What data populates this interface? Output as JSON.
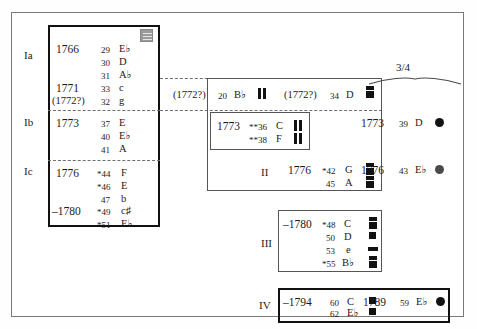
{
  "figure": {
    "time_signature_label": "3/4",
    "groups": {
      "Ia": "Ia",
      "Ib": "Ib",
      "Ic": "Ic",
      "II": "II",
      "III": "III",
      "IV": "IV"
    }
  },
  "column_left": {
    "sections": [
      {
        "group": "Ia",
        "entries": [
          {
            "year": "1766",
            "num": "29",
            "key": "E♭"
          },
          {
            "year": "",
            "num": "30",
            "key": "D"
          },
          {
            "year": "",
            "num": "31",
            "key": "A♭"
          },
          {
            "year": "1771",
            "num": "33",
            "key": "c"
          },
          {
            "year": "(1772?)",
            "num": "32",
            "key": "g"
          }
        ]
      },
      {
        "group": "Ib",
        "entries": [
          {
            "year": "1773",
            "num": "37",
            "key": "E"
          },
          {
            "year": "",
            "num": "40",
            "key": "E♭"
          },
          {
            "year": "",
            "num": "41",
            "key": "A"
          }
        ]
      },
      {
        "group": "Ic",
        "entries": [
          {
            "year": "1776",
            "num": "*44",
            "key": "F"
          },
          {
            "year": "",
            "num": "*46",
            "key": "E"
          },
          {
            "year": "",
            "num": "47",
            "key": "b"
          },
          {
            "year": "–1780",
            "num": "*49",
            "key": "c♯"
          },
          {
            "year": "",
            "num": "*51",
            "key": "E♭"
          }
        ]
      }
    ]
  },
  "column_middle": {
    "top_row": [
      {
        "year": "(1772?)",
        "num": "20",
        "key": "B♭",
        "marker": "bar-pair"
      },
      {
        "year": "(1772?)",
        "num": "34",
        "key": "D",
        "marker": "stacked-square"
      }
    ],
    "box_1773": {
      "entries": [
        {
          "year": "1773",
          "num": "**36",
          "key": "C",
          "marker": "bar-pair"
        },
        {
          "year": "",
          "num": "**38",
          "key": "F",
          "marker": "bar-pair"
        }
      ]
    },
    "section_II": {
      "group": "II",
      "entries": [
        {
          "year": "1776",
          "num": "*42",
          "key": "G",
          "marker": "stacked-square"
        },
        {
          "year": "",
          "num": "45",
          "key": "A",
          "marker": "stacked-square"
        }
      ]
    },
    "section_III": {
      "group": "III",
      "entries": [
        {
          "year": "–1780",
          "num": "*48",
          "key": "C",
          "marker": "stacked-square"
        },
        {
          "year": "",
          "num": "50",
          "key": "D",
          "marker": "square"
        },
        {
          "year": "",
          "num": "53",
          "key": "e",
          "marker": "wide-square"
        },
        {
          "year": "",
          "num": "*55",
          "key": "B♭",
          "marker": "stacked-square"
        }
      ]
    },
    "section_IV": {
      "group": "IV",
      "entries": [
        {
          "year": "–1794",
          "num": "60",
          "key": "C",
          "marker": "square"
        },
        {
          "year": "",
          "num": "62",
          "key": "E♭",
          "marker": "square"
        }
      ]
    }
  },
  "column_right": {
    "entries": [
      {
        "year": "1773",
        "num": "39",
        "key": "D",
        "marker": "circle-black"
      },
      {
        "year": "1776",
        "num": "43",
        "key": "E♭",
        "marker": "circle-grey"
      },
      {
        "year": "1789",
        "num": "59",
        "key": "E♭",
        "marker": "circle-black"
      }
    ]
  },
  "colors": {
    "marker_black": "#121212",
    "marker_grey": "#4a4a4a",
    "frame": "#7a7a7a",
    "box_thick": "#111111",
    "box_thin": "#555555",
    "dashed": "#6f6f6f",
    "icon_grey": "#9b9b9b"
  }
}
